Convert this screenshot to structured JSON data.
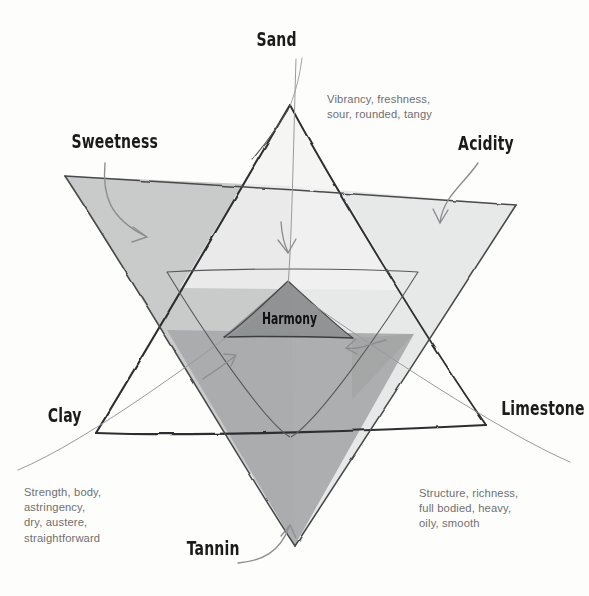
{
  "diagram": {
    "center_label": "Harmony",
    "vertices": [
      {
        "id": "sand",
        "label": "Sand"
      },
      {
        "id": "sweetness",
        "label": "Sweetness"
      },
      {
        "id": "acidity",
        "label": "Acidity"
      },
      {
        "id": "clay",
        "label": "Clay"
      },
      {
        "id": "limestone",
        "label": "Limestone"
      },
      {
        "id": "tannin",
        "label": "Tannin"
      }
    ],
    "descriptors": [
      {
        "id": "acidity-descriptor",
        "text": "Vibrancy, freshness,\nsour, rounded, tangy"
      },
      {
        "id": "tannin-descriptor",
        "text": "Strength, body,\nastringency,\ndry, austere,\nstraightforward"
      },
      {
        "id": "limestone-descriptor",
        "text": "Structure, richness,\nfull bodied, heavy,\noily, smooth"
      }
    ],
    "colors": {
      "ink": "#3b3b3d",
      "ink_light": "#8a8a8c",
      "text_grey": "#6f6f70",
      "sweetness_fill": "#c3c4c4",
      "acidity_fill": "#e3e4e4",
      "tannin_fill": "#a9aaab",
      "harmony_fill": "#8e9091",
      "background": "#fdfdfc"
    }
  }
}
